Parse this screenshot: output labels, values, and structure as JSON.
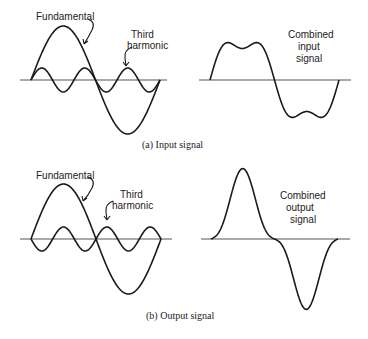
{
  "panel_a": {
    "caption": "(a) Input signal",
    "left": {
      "fundamental_label": "Fundamental",
      "third_label_line1": "Third",
      "third_label_line2": "harmonic"
    },
    "right": {
      "label_line1": "Combined",
      "label_line2": "input",
      "label_line3": "signal"
    }
  },
  "panel_b": {
    "caption": "(b) Output signal",
    "left": {
      "fundamental_label": "Fundamental",
      "third_label_line1": "Third",
      "third_label_line2": "harmonic"
    },
    "right": {
      "label_line1": "Combined",
      "label_line2": "output",
      "label_line3": "signal"
    }
  },
  "colors": {
    "stroke": "#1a1a1a",
    "axis": "#555555"
  }
}
